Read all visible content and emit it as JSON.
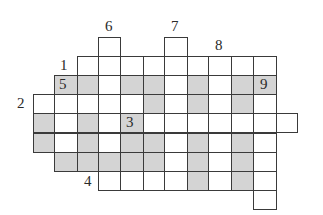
{
  "puzzle": {
    "type": "crossword",
    "colors": {
      "line": "#3a3a3a",
      "shaded": "#d4d4d4",
      "white": "#ffffff",
      "text": "#2a2a2a"
    },
    "geometry": {
      "col_x": [
        33,
        54,
        77,
        98,
        120,
        143,
        164,
        187,
        208,
        231,
        253,
        276
      ],
      "col_w": [
        22,
        24,
        22,
        23,
        24,
        22,
        24,
        22,
        24,
        23,
        24,
        22
      ],
      "row_y": [
        37,
        56,
        75,
        94,
        113,
        133,
        152,
        171,
        190
      ],
      "row_h": 20
    },
    "columns": [
      "A",
      "B",
      "C",
      "D",
      "E",
      "F",
      "G",
      "H",
      "I",
      "J",
      "K",
      "L"
    ],
    "rows": [
      {
        "row": 0,
        "cells": {
          "D": "W",
          "G": "W"
        }
      },
      {
        "row": 1,
        "cells": {
          "C": "W",
          "D": "W",
          "E": "W",
          "F": "W",
          "G": "W",
          "H": "W",
          "I": "W",
          "J": "W",
          "K": "W"
        }
      },
      {
        "row": 2,
        "cells": {
          "B": "S",
          "C": "S",
          "D": "W",
          "E": "S",
          "F": "S",
          "G": "W",
          "H": "S",
          "I": "W",
          "J": "S",
          "K": "S"
        }
      },
      {
        "row": 3,
        "cells": {
          "A": "W",
          "B": "W",
          "C": "W",
          "D": "W",
          "E": "W",
          "F": "S",
          "G": "W",
          "H": "S",
          "I": "W",
          "J": "S",
          "K": "W"
        }
      },
      {
        "row": 4,
        "cells": {
          "A": "S",
          "B": "W",
          "C": "S",
          "D": "W",
          "E": "S",
          "F": "W",
          "G": "W",
          "H": "W",
          "I": "W",
          "J": "W",
          "K": "W",
          "L": "W"
        }
      },
      {
        "row": 5,
        "cells": {
          "A": "S",
          "B": "W",
          "C": "S",
          "D": "W",
          "E": "S",
          "F": "S",
          "G": "W",
          "H": "S",
          "I": "W",
          "J": "S",
          "K": "W"
        }
      },
      {
        "row": 6,
        "cells": {
          "B": "S",
          "C": "S",
          "D": "S",
          "E": "S",
          "F": "S",
          "G": "W",
          "H": "S",
          "I": "W",
          "J": "S",
          "K": "W"
        }
      },
      {
        "row": 7,
        "cells": {
          "D": "W",
          "E": "W",
          "F": "W",
          "G": "W",
          "H": "S",
          "I": "W",
          "J": "S",
          "K": "W"
        }
      },
      {
        "row": 8,
        "cells": {
          "K": "W"
        }
      }
    ],
    "labels": [
      {
        "text": "1",
        "x": 60,
        "y": 58
      },
      {
        "text": "2",
        "x": 17,
        "y": 96
      },
      {
        "text": "3",
        "x": 126,
        "y": 115
      },
      {
        "text": "4",
        "x": 84,
        "y": 174
      },
      {
        "text": "5",
        "x": 59,
        "y": 77
      },
      {
        "text": "6",
        "x": 105,
        "y": 19
      },
      {
        "text": "7",
        "x": 171,
        "y": 19
      },
      {
        "text": "8",
        "x": 215,
        "y": 38
      },
      {
        "text": "9",
        "x": 260,
        "y": 77
      }
    ]
  }
}
